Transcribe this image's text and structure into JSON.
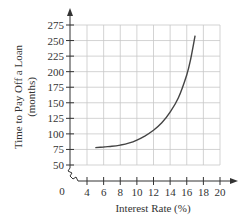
{
  "chart_data": {
    "type": "line",
    "title": "",
    "xlabel": "Interest Rate (%)",
    "ylabel_line1": "Time to Pay Off a Loan",
    "ylabel_line2": "(months)",
    "origin_label": "0",
    "xlim": [
      0,
      21
    ],
    "ylim": [
      0,
      285
    ],
    "x_ticks": [
      4,
      6,
      8,
      10,
      12,
      14,
      16,
      18,
      20
    ],
    "y_ticks": [
      50,
      75,
      100,
      125,
      150,
      175,
      200,
      225,
      250,
      275
    ],
    "axis_break": true,
    "grid": true,
    "series": [
      {
        "name": "Time to Pay Off a Loan",
        "x": [
          5,
          6,
          7,
          8,
          9,
          10,
          11,
          12,
          13,
          14,
          15,
          16,
          16.5,
          17
        ],
        "y": [
          78,
          79,
          80,
          82,
          85,
          90,
          97,
          106,
          118,
          135,
          158,
          195,
          222,
          258
        ]
      }
    ]
  },
  "colors": {
    "axis": "#333333",
    "grid": "#c8c8c8",
    "curve": "#444444"
  }
}
